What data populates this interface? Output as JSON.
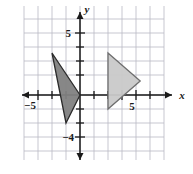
{
  "chart_data": {
    "type": "scatter",
    "title": "",
    "xlabel": "x",
    "ylabel": "y",
    "grid": true,
    "legend": false,
    "xlim": [
      -6,
      6
    ],
    "ylim": [
      -6,
      5
    ],
    "x_ticks": [
      -5,
      5
    ],
    "y_ticks": [
      5,
      -4
    ],
    "x_tick_labels": [
      "−5",
      "5"
    ],
    "y_tick_labels": [
      "5",
      "−4"
    ],
    "grid_step": 1,
    "axis_origin_label": "",
    "shapes": [
      {
        "name": "preimage-triangle",
        "fill": "#818181",
        "stroke": "#2b2b2b",
        "vertices": [
          [
            -2,
            3
          ],
          [
            0,
            0
          ],
          [
            -1,
            -2
          ]
        ]
      },
      {
        "name": "image-triangle",
        "fill": "#c9c9c9",
        "stroke": "#6e6e6e",
        "vertices": [
          [
            2,
            3
          ],
          [
            4.3,
            1
          ],
          [
            2,
            -1
          ]
        ]
      }
    ],
    "annotations": []
  },
  "labels": {
    "x_axis": "x",
    "y_axis": "y",
    "x_neg_five": "−5",
    "x_pos_five": "5",
    "y_pos_five": "5",
    "y_neg_four": "−4"
  }
}
